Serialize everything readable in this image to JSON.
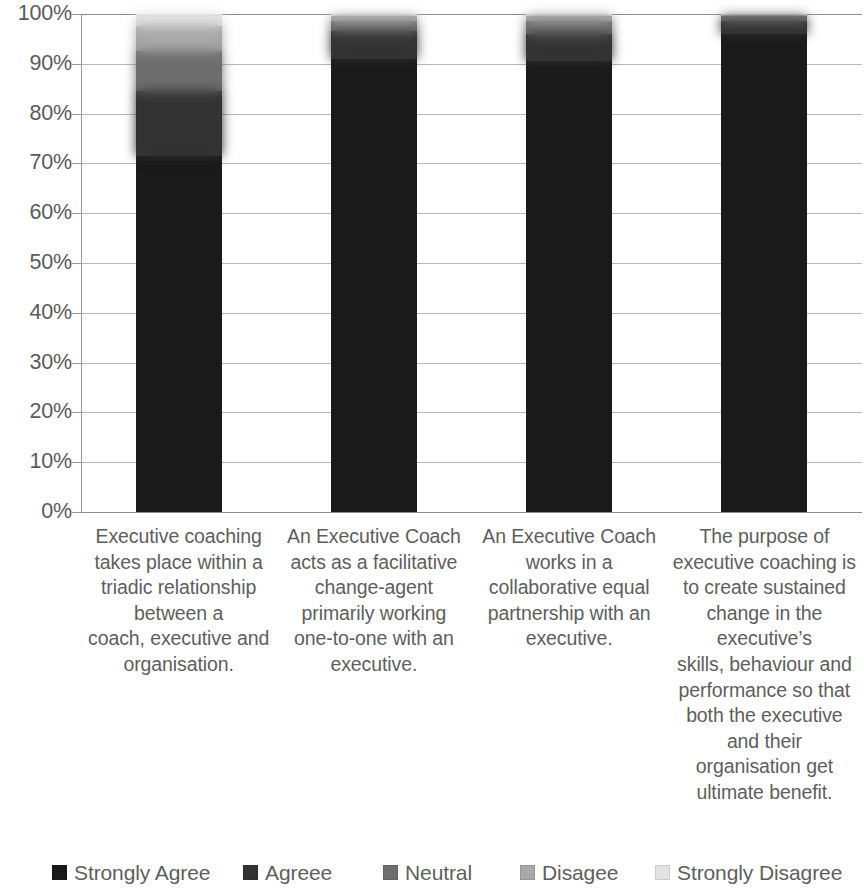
{
  "chart_data": {
    "type": "bar",
    "subtype": "100% stacked bar",
    "title": "",
    "subtitle": "",
    "xlabel": "",
    "ylabel": "",
    "ylim": [
      0,
      100
    ],
    "y_tick_labels": [
      "100%",
      "90%",
      "80%",
      "70%",
      "60%",
      "50%",
      "40%",
      "30%",
      "20%",
      "10%",
      "0%"
    ],
    "y_tick_values": [
      100,
      90,
      80,
      70,
      60,
      50,
      40,
      30,
      20,
      10,
      0
    ],
    "grid": true,
    "legend_position": "bottom",
    "categories": [
      "Executive coaching takes place within a triadic relationship between a coach, executive and organisation.",
      "An Executive Coach acts as a facilitative change-agent primarily working one-to-one with an executive.",
      "An Executive Coach works in a collaborative equal partnership with an executive.",
      "The purpose of executive coaching is to create sustained change in the executive’s skills, behaviour and performance so that both the executive and their organisation get ultimate benefit."
    ],
    "category_lines": [
      [
        "Executive coaching",
        "takes place within  a",
        "triadic relationship",
        "between a",
        "coach, executive and",
        "organisation."
      ],
      [
        "An Executive Coach",
        "acts as a facilitative",
        "change-agent",
        "primarily working",
        "one-to-one with  an",
        "executive."
      ],
      [
        "An Executive Coach",
        "works in a",
        "collaborative equal",
        "partnership with an",
        "executive."
      ],
      [
        "The purpose of",
        "executive coaching is",
        "to create sustained",
        "change in the",
        "executive’s",
        "skills, behaviour and",
        "performance so that",
        "both the executive",
        "and their",
        "organisation get",
        "ultimate benefit."
      ]
    ],
    "series": [
      {
        "name": "Strongly Agree",
        "color": "#1a1a1a",
        "values": [
          71.5,
          91.0,
          90.5,
          96.0
        ]
      },
      {
        "name": "Agreee",
        "color": "#333333",
        "values": [
          13.0,
          5.5,
          5.5,
          2.5
        ]
      },
      {
        "name": "Neutral",
        "color": "#6e6e6e",
        "values": [
          8.0,
          2.0,
          2.5,
          1.0
        ]
      },
      {
        "name": "Disagee",
        "color": "#a8a8a8",
        "values": [
          5.0,
          1.0,
          1.0,
          0.3
        ]
      },
      {
        "name": "Strongly Disagree",
        "color": "#e2e2e2",
        "values": [
          2.5,
          0.5,
          0.5,
          0.2
        ]
      }
    ]
  },
  "legend": {
    "items": [
      {
        "label": "Strongly Agree",
        "color": "#1a1a1a"
      },
      {
        "label": "Agreee",
        "color": "#333333"
      },
      {
        "label": "Neutral",
        "color": "#6e6e6e"
      },
      {
        "label": "Disagee",
        "color": "#a8a8a8"
      },
      {
        "label": "Strongly Disagree",
        "color": "#e2e2e2"
      }
    ]
  }
}
